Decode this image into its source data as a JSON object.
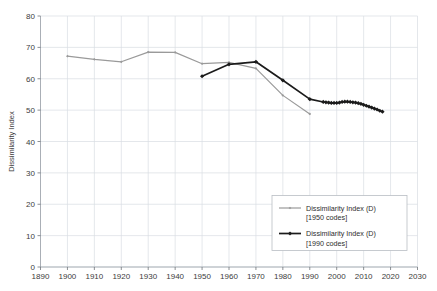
{
  "chart_data": {
    "type": "line",
    "title": "",
    "xlabel": "",
    "ylabel": "Dissimilarity Index",
    "xlim": [
      1890,
      2030
    ],
    "ylim": [
      0,
      80
    ],
    "xticks": [
      1890,
      1900,
      1910,
      1920,
      1930,
      1940,
      1950,
      1960,
      1970,
      1980,
      1990,
      2000,
      2010,
      2020,
      2030
    ],
    "yticks": [
      0,
      10,
      20,
      30,
      40,
      50,
      60,
      70,
      80
    ],
    "grid": true,
    "legend_position": "lower-right",
    "series": [
      {
        "name": "Dissimilarity Index (D) [1950 codes]",
        "label_line1": "Dissimilarity Index (D)",
        "label_line2": "[1950 codes]",
        "color": "#9a9a9a",
        "marker": "diamond-small",
        "x": [
          1900,
          1910,
          1920,
          1930,
          1940,
          1950,
          1960,
          1970,
          1980,
          1990
        ],
        "values": [
          67.2,
          66.2,
          65.4,
          68.5,
          68.4,
          64.8,
          65.2,
          63.3,
          54.7,
          48.8
        ]
      },
      {
        "name": "Dissimilarity Index (D) [1990 codes]",
        "label_line1": "Dissimilarity Index (D)",
        "label_line2": "[1990 codes]",
        "color": "#1b1b1b",
        "marker": "diamond",
        "x": [
          1950,
          1960,
          1970,
          1980,
          1990,
          1995,
          1996,
          1997,
          1998,
          1999,
          2000,
          2001,
          2002,
          2003,
          2004,
          2005,
          2006,
          2007,
          2008,
          2009,
          2010,
          2011,
          2012,
          2013,
          2014,
          2015,
          2016,
          2017
        ],
        "values": [
          60.8,
          64.6,
          65.4,
          59.5,
          53.5,
          52.6,
          52.5,
          52.4,
          52.3,
          52.3,
          52.3,
          52.4,
          52.6,
          52.7,
          52.7,
          52.6,
          52.5,
          52.4,
          52.2,
          52.0,
          51.7,
          51.4,
          51.1,
          50.8,
          50.5,
          50.2,
          49.8,
          49.5
        ]
      }
    ]
  },
  "axes": {
    "y_axis_title": "Dissimilarity Index"
  }
}
